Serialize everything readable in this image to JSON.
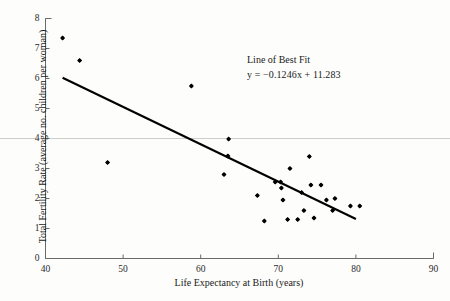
{
  "chart_data": {
    "type": "scatter",
    "title": "",
    "xlabel": "Life Expectancy at Birth (years)",
    "ylabel": "Total Fertility Rate (average no. children per woman)",
    "xlim": [
      40,
      90
    ],
    "ylim": [
      0,
      8
    ],
    "xticks": [
      40,
      50,
      60,
      70,
      80,
      90
    ],
    "yticks": [
      0,
      1,
      2,
      3,
      4,
      5,
      6,
      7,
      8
    ],
    "grid": "single horizontal gridline at y=4",
    "gridlines_y": [
      4
    ],
    "legend": "none",
    "series": [
      {
        "name": "Countries",
        "marker": "filled-diamond",
        "color": "#000000",
        "points": [
          {
            "x": 42.2,
            "y": 7.35
          },
          {
            "x": 44.4,
            "y": 6.6
          },
          {
            "x": 48.0,
            "y": 3.2
          },
          {
            "x": 58.8,
            "y": 5.75
          },
          {
            "x": 63.6,
            "y": 3.98
          },
          {
            "x": 63.5,
            "y": 3.42
          },
          {
            "x": 63.0,
            "y": 2.8
          },
          {
            "x": 67.3,
            "y": 2.1
          },
          {
            "x": 68.2,
            "y": 1.25
          },
          {
            "x": 69.6,
            "y": 2.55
          },
          {
            "x": 70.3,
            "y": 2.55
          },
          {
            "x": 70.4,
            "y": 2.35
          },
          {
            "x": 70.6,
            "y": 1.95
          },
          {
            "x": 71.2,
            "y": 1.3
          },
          {
            "x": 71.5,
            "y": 3.0
          },
          {
            "x": 72.5,
            "y": 1.3
          },
          {
            "x": 73.0,
            "y": 2.2
          },
          {
            "x": 73.3,
            "y": 1.6
          },
          {
            "x": 74.0,
            "y": 3.4
          },
          {
            "x": 74.2,
            "y": 2.45
          },
          {
            "x": 74.6,
            "y": 1.35
          },
          {
            "x": 75.5,
            "y": 2.45
          },
          {
            "x": 76.2,
            "y": 1.95
          },
          {
            "x": 77.0,
            "y": 1.6
          },
          {
            "x": 77.3,
            "y": 2.0
          },
          {
            "x": 79.3,
            "y": 1.75
          },
          {
            "x": 80.5,
            "y": 1.75
          }
        ]
      }
    ],
    "trendline": {
      "label": "Line of Best Fit",
      "equation": "y = −0.1246x + 11.283",
      "slope": -0.1246,
      "intercept": 11.283,
      "x_start": 42.2,
      "x_end": 80.0,
      "color": "#000000"
    }
  },
  "axes": {
    "y_tick_labels": [
      "8",
      "7",
      "6",
      "5",
      "4",
      "3",
      "2",
      "1",
      "0"
    ],
    "x_tick_labels": [
      "40",
      "50",
      "60",
      "70",
      "80",
      "90"
    ],
    "y_title": "Total Fertility Rate (average no. children per woman)",
    "x_title": "Life Expectancy at Birth (years)"
  },
  "annotation": {
    "line1": "Line of Best Fit",
    "line2": "y = −0.1246x + 11.283"
  },
  "colors": {
    "marker": "#000000",
    "trendline": "#000000",
    "axis": "#6a6a6a",
    "gridline": "#b8b8b8",
    "background": "#fdfdfc"
  }
}
